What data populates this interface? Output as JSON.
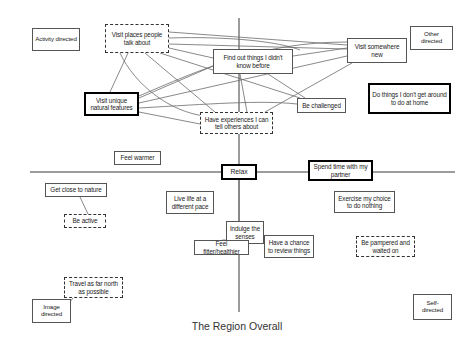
{
  "figure": {
    "title": "The Region Overall",
    "type": "perceptual-map-diagram",
    "axes": {
      "horizontal_label": "",
      "vertical_label": "",
      "left_pole": "Activity directed",
      "right_pole": "Other directed",
      "bottom_left_pole": "Image directed",
      "bottom_right_pole": "Self-directed"
    }
  },
  "nodes": [
    {
      "id": "activity-directed",
      "label": "Activity directed",
      "style": "solid-thin",
      "x": 32,
      "y": 28,
      "w": 48,
      "h": 23,
      "fs": 6.2
    },
    {
      "id": "visit-places-people-talk-about",
      "label": "Visit places people talk about",
      "style": "dashed",
      "x": 105,
      "y": 24,
      "w": 64,
      "h": 29,
      "fs": 6.3
    },
    {
      "id": "find-out-things-i-didnt-know-before",
      "label": "Find out things I didn't know before",
      "style": "solid-thin",
      "x": 213,
      "y": 49,
      "w": 80,
      "h": 25,
      "fs": 6.3
    },
    {
      "id": "visit-somewhere-new",
      "label": "Visit somewhere new",
      "style": "solid-thin",
      "x": 347,
      "y": 38,
      "w": 60,
      "h": 25,
      "fs": 6.3
    },
    {
      "id": "other-directed",
      "label": "Other directed",
      "style": "solid-thin",
      "x": 410,
      "y": 26,
      "w": 43,
      "h": 24,
      "fs": 6.2
    },
    {
      "id": "visit-unique-natural-features",
      "label": "Visit unique natural features",
      "style": "solid-thick",
      "x": 84,
      "y": 92,
      "w": 55,
      "h": 24,
      "fs": 6.3
    },
    {
      "id": "be-challenged",
      "label": "Be challenged",
      "style": "solid-thin",
      "x": 297,
      "y": 98,
      "w": 49,
      "h": 15,
      "fs": 6.3
    },
    {
      "id": "do-things-i-dont-get-around-to-do-at-home",
      "label": "Do things I don't get around to do at home",
      "style": "solid-thick",
      "x": 368,
      "y": 83,
      "w": 83,
      "h": 31,
      "fs": 6.3
    },
    {
      "id": "have-experiences-i-can-tell-others-about",
      "label": "Have experiences I can tell others about",
      "style": "dashed",
      "x": 200,
      "y": 112,
      "w": 73,
      "h": 22,
      "fs": 6.3
    },
    {
      "id": "feel-warmer",
      "label": "Feel warmer",
      "style": "solid-thin",
      "x": 114,
      "y": 151,
      "w": 47,
      "h": 14,
      "fs": 6.3
    },
    {
      "id": "relax",
      "label": "Relax",
      "style": "solid-thick",
      "x": 221,
      "y": 164,
      "w": 36,
      "h": 16,
      "fs": 6.8
    },
    {
      "id": "spend-time-with-my-partner",
      "label": "Spend time with my partner",
      "style": "solid-thick",
      "x": 308,
      "y": 160,
      "w": 65,
      "h": 21,
      "fs": 6.4
    },
    {
      "id": "get-close-to-nature",
      "label": "Get close to nature",
      "style": "solid-thin",
      "x": 45,
      "y": 183,
      "w": 62,
      "h": 14,
      "fs": 6.3
    },
    {
      "id": "live-life-at-a-different-pace",
      "label": "Live life at a different pace",
      "style": "solid-thin",
      "x": 166,
      "y": 191,
      "w": 48,
      "h": 23,
      "fs": 6.3
    },
    {
      "id": "exercise-my-choice-to-do-nothing",
      "label": "Exercise my choice to do nothing",
      "style": "solid-thin",
      "x": 334,
      "y": 191,
      "w": 61,
      "h": 22,
      "fs": 6.3
    },
    {
      "id": "be-active",
      "label": "Be active",
      "style": "dashed",
      "x": 64,
      "y": 214,
      "w": 42,
      "h": 14,
      "fs": 6.3
    },
    {
      "id": "indulge-the-senses",
      "label": "Indulge the senses",
      "style": "solid-thin",
      "x": 226,
      "y": 221,
      "w": 38,
      "h": 23,
      "fs": 6.3
    },
    {
      "id": "have-a-chance-to-review-things",
      "label": "Have a chance to review things",
      "style": "solid-thin",
      "x": 264,
      "y": 235,
      "w": 50,
      "h": 23,
      "fs": 6.3
    },
    {
      "id": "feel-fitter-healthier",
      "label": "Feel fitter/healthier",
      "style": "solid-thin",
      "x": 194,
      "y": 240,
      "w": 55,
      "h": 15,
      "fs": 6.3
    },
    {
      "id": "be-pampered-and-waited-on",
      "label": "Be pampered and waited on",
      "style": "dashed",
      "x": 356,
      "y": 236,
      "w": 59,
      "h": 21,
      "fs": 6.3
    },
    {
      "id": "travel-as-far-north-as-possible",
      "label": "Travel as far north as possible",
      "style": "dashed",
      "x": 64,
      "y": 277,
      "w": 59,
      "h": 21,
      "fs": 6.3
    },
    {
      "id": "image-directed",
      "label": "Image directed",
      "style": "solid-thin",
      "x": 32,
      "y": 299,
      "w": 39,
      "h": 24,
      "fs": 6.2
    },
    {
      "id": "self-directed",
      "label": "Self- directed",
      "style": "solid-thin",
      "x": 413,
      "y": 294,
      "w": 39,
      "h": 26,
      "fs": 6.2
    }
  ],
  "axis_lines": [
    {
      "id": "horizontal-axis",
      "x1": 30,
      "y1": 172,
      "x2": 455,
      "y2": 172
    },
    {
      "id": "vertical-axis",
      "x1": 239,
      "y1": 18,
      "x2": 239,
      "y2": 312
    }
  ],
  "links": [
    {
      "from": "visit-places-people-talk-about",
      "to": "visit-somewhere-new",
      "x1": 169,
      "y1": 32,
      "x2": 347,
      "y2": 45
    },
    {
      "from": "visit-places-people-talk-about",
      "to": "visit-somewhere-new",
      "x1": 169,
      "y1": 44,
      "x2": 347,
      "y2": 49
    },
    {
      "from": "visit-places-people-talk-about",
      "to": "find-out-things-i-didnt-know-before",
      "x1": 169,
      "y1": 48,
      "x2": 213,
      "y2": 58
    },
    {
      "from": "visit-places-people-talk-about",
      "to": "visit-unique-natural-features",
      "x1": 128,
      "y1": 53,
      "x2": 110,
      "y2": 92
    },
    {
      "from": "visit-places-people-talk-about",
      "to": "have-experiences-i-can-tell-others-about",
      "x1": 145,
      "y1": 53,
      "x2": 215,
      "y2": 112
    },
    {
      "from": "visit-places-people-talk-about",
      "to": "be-challenged",
      "x1": 160,
      "y1": 53,
      "x2": 300,
      "y2": 98
    },
    {
      "from": "visit-unique-natural-features",
      "to": "find-out-things-i-didnt-know-before",
      "x1": 139,
      "y1": 98,
      "x2": 213,
      "y2": 66
    },
    {
      "from": "visit-unique-natural-features",
      "to": "visit-somewhere-new",
      "x1": 139,
      "y1": 103,
      "x2": 347,
      "y2": 56
    },
    {
      "from": "visit-unique-natural-features",
      "to": "have-experiences-i-can-tell-others-about",
      "x1": 139,
      "y1": 112,
      "x2": 200,
      "y2": 124
    },
    {
      "from": "find-out-things-i-didnt-know-before",
      "to": "visit-somewhere-new",
      "x1": 293,
      "y1": 56,
      "x2": 347,
      "y2": 48
    },
    {
      "from": "find-out-things-i-didnt-know-before",
      "to": "have-experiences-i-can-tell-others-about",
      "x1": 240,
      "y1": 74,
      "x2": 247,
      "y2": 112
    },
    {
      "from": "find-out-things-i-didnt-know-before",
      "to": "be-challenged",
      "x1": 268,
      "y1": 74,
      "x2": 305,
      "y2": 98
    },
    {
      "from": "have-experiences-i-can-tell-others-about",
      "to": "visit-somewhere-new",
      "x1": 265,
      "y1": 112,
      "x2": 352,
      "y2": 63
    },
    {
      "from": "get-close-to-nature",
      "to": "be-active",
      "x1": 80,
      "y1": 197,
      "x2": 88,
      "y2": 214
    },
    {
      "from": "relax",
      "to": "indulge-the-senses",
      "x1": 239,
      "y1": 180,
      "x2": 239,
      "y2": 221
    },
    {
      "from": "indulge-the-senses",
      "to": "feel-fitter-healthier",
      "x1": 227,
      "y1": 240,
      "x2": 222,
      "y2": 240
    },
    {
      "from": "indulge-the-senses",
      "to": "have-a-chance-to-review-things",
      "x1": 264,
      "y1": 238,
      "x2": 265,
      "y2": 238
    },
    {
      "from": "image-directed",
      "to": "travel-as-far-north-as-possible",
      "x1": 70,
      "y1": 302,
      "x2": 73,
      "y2": 298
    }
  ],
  "curved_links": [
    {
      "from": "visit-places-people-talk-about",
      "to": "find-out-things-i-didnt-know-before",
      "d": "M 169 38 C 230 36, 280 42, 300 50"
    },
    {
      "from": "visit-unique-natural-features",
      "to": "visit-somewhere-new",
      "d": "M 139 96 C 200 70, 260 42, 347 42"
    },
    {
      "from": "visit-places-people-talk-about",
      "to": "have-experiences-i-can-tell-others-about",
      "d": "M 120 53 C 135 85, 170 112, 205 116"
    },
    {
      "from": "visit-unique-natural-features",
      "to": "be-challenged",
      "d": "M 139 108 C 210 104, 260 100, 297 104"
    }
  ]
}
